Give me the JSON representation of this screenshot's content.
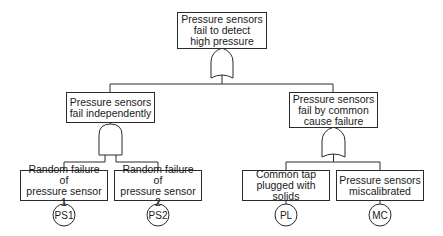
{
  "diagram": {
    "type": "fault-tree",
    "line_color": "#2a2a2a",
    "top_event": {
      "label": "Pressure sensors\nfail to detect\nhigh pressure",
      "gate": "OR"
    },
    "intermediate_events": [
      {
        "label": "Pressure sensors\nfail independently",
        "gate": "AND"
      },
      {
        "label": "Pressure sensors\nfail by common\ncause failure",
        "gate": "OR"
      }
    ],
    "basic_events": [
      {
        "label": "Random failure of\npressure sensor 1",
        "code": "PS1",
        "parent": 0
      },
      {
        "label": "Random failure of\npressure sensor 2",
        "code": "PS2",
        "parent": 0
      },
      {
        "label": "Common tap\nplugged with solids",
        "code": "PL",
        "parent": 1
      },
      {
        "label": "Pressure sensors\nmiscalibrated",
        "code": "MC",
        "parent": 1
      }
    ]
  }
}
